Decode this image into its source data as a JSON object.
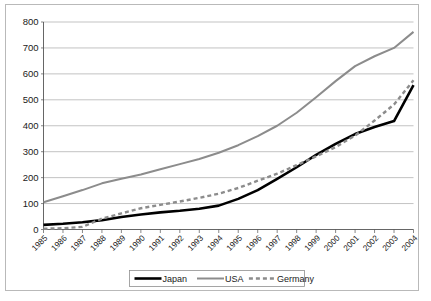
{
  "chart_data": {
    "type": "line",
    "title": "",
    "subtitle": "",
    "xlabel": "",
    "ylabel": "",
    "ylim": [
      0,
      800
    ],
    "ytick_values": [
      0,
      100,
      200,
      300,
      400,
      500,
      600,
      700,
      800
    ],
    "ytick_labels": [
      "0",
      "100",
      "200",
      "300",
      "400",
      "500",
      "600",
      "700",
      "800"
    ],
    "grid": true,
    "grid_axis": "y",
    "legend_position": "bottom",
    "categories": [
      "1985",
      "1986",
      "1987",
      "1988",
      "1989",
      "1990",
      "1991",
      "1992",
      "1993",
      "1994",
      "1995",
      "1996",
      "1997",
      "1998",
      "1999",
      "2000",
      "2001",
      "2002",
      "2003",
      "2004"
    ],
    "series": [
      {
        "name": "Japan",
        "color": "#000000",
        "style": "solid",
        "width": 2.6,
        "values": [
          18,
          22,
          28,
          36,
          48,
          58,
          66,
          72,
          80,
          92,
          118,
          152,
          195,
          240,
          288,
          330,
          368,
          395,
          418,
          557
        ]
      },
      {
        "name": "USA",
        "color": "#8c8c8c",
        "style": "solid",
        "width": 2.0,
        "values": [
          105,
          128,
          152,
          178,
          196,
          212,
          232,
          252,
          272,
          296,
          325,
          360,
          400,
          450,
          510,
          572,
          630,
          668,
          700,
          762
        ]
      },
      {
        "name": "Germany",
        "color": "#8c8c8c",
        "style": "dashed",
        "width": 2.4,
        "values": [
          3,
          5,
          10,
          42,
          62,
          82,
          95,
          108,
          122,
          138,
          160,
          188,
          215,
          248,
          282,
          318,
          362,
          420,
          482,
          575
        ]
      }
    ],
    "legend_entries": [
      {
        "label": "Japan",
        "color": "#000000",
        "style": "solid",
        "width": 2.6
      },
      {
        "label": "USA",
        "color": "#8c8c8c",
        "style": "solid",
        "width": 2.0
      },
      {
        "label": "Germany",
        "color": "#8c8c8c",
        "style": "dashed",
        "width": 2.4
      }
    ]
  },
  "legend": {
    "japan_label": "Japan",
    "usa_label": "USA",
    "germany_label": "Germany"
  },
  "axes": {
    "y_labels": [
      "800",
      "700",
      "600",
      "500",
      "400",
      "300",
      "200",
      "100",
      "0"
    ],
    "x_labels": [
      "1985",
      "1986",
      "1987",
      "1988",
      "1989",
      "1990",
      "1991",
      "1992",
      "1993",
      "1994",
      "1995",
      "1996",
      "1997",
      "1998",
      "1999",
      "2000",
      "2001",
      "2002",
      "2003",
      "2004"
    ]
  }
}
